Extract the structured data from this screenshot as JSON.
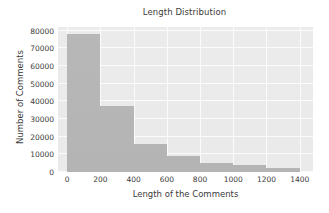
{
  "chart_data": {
    "type": "bar",
    "title": "Length Distribution",
    "xlabel": "Length of the Comments",
    "ylabel": "Number of Comments",
    "grid": true,
    "legend": null,
    "xlim": [
      -55,
      1480
    ],
    "ylim": [
      0,
      82000
    ],
    "xticks": [
      "0",
      "200",
      "400",
      "600",
      "800",
      "1000",
      "1200",
      "1400"
    ],
    "xtick_values": [
      0,
      200,
      400,
      600,
      800,
      1000,
      1200,
      1400
    ],
    "yticks": [
      "0",
      "10000",
      "20000",
      "30000",
      "40000",
      "50000",
      "60000",
      "70000",
      "80000"
    ],
    "ytick_values": [
      0,
      10000,
      20000,
      30000,
      40000,
      50000,
      60000,
      70000,
      80000
    ],
    "bin_edges": [
      0,
      200,
      400,
      600,
      800,
      1000,
      1200,
      1400
    ],
    "categories": [
      "0-200",
      "200-400",
      "400-600",
      "600-800",
      "800-1000",
      "1000-1200",
      "1200-1400"
    ],
    "values": [
      78000,
      37500,
      16000,
      8800,
      5200,
      4000,
      2500
    ],
    "bar_color": "#b4b4b4",
    "plot_background": "#eaeaea",
    "grid_color": "#fbfbfb",
    "text_color": "#3b3b3b"
  }
}
